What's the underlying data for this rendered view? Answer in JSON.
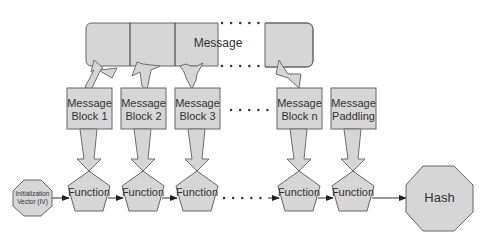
{
  "diagram": {
    "message_bar": {
      "label": "Message"
    },
    "blocks": [
      {
        "line1": "Message",
        "line2": "Block 1"
      },
      {
        "line1": "Message",
        "line2": "Block 2"
      },
      {
        "line1": "Message",
        "line2": "Block 3"
      },
      {
        "line1": "Message",
        "line2": "Block n"
      },
      {
        "line1": "Message",
        "line2": "Paddling"
      }
    ],
    "iv": {
      "line1": "Initialization",
      "line2": "Vector (IV)"
    },
    "functions": [
      {
        "label": "Function"
      },
      {
        "label": "Function"
      },
      {
        "label": "Function"
      },
      {
        "label": "Function"
      },
      {
        "label": "Function"
      }
    ],
    "output": {
      "label": "Hash"
    },
    "colors": {
      "fill": "#d6d6d6",
      "stroke": "#666666",
      "text": "#333333"
    }
  }
}
